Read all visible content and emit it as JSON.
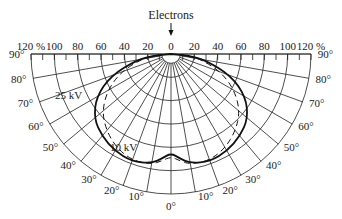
{
  "figure": {
    "title_label": "Electrons",
    "arrow": "down-arrow",
    "radial_axis": {
      "unit": "%",
      "ticks_left": [
        "120 %",
        "100",
        "80",
        "60",
        "40",
        "20"
      ],
      "center_tick": "0",
      "ticks_right": [
        "20",
        "40",
        "60",
        "80",
        "100",
        "120 %"
      ],
      "max": 120,
      "step": 20
    },
    "angle_labels_left": [
      "90°",
      "80°",
      "70°",
      "60°",
      "50°",
      "40°",
      "30°",
      "20°",
      "10°"
    ],
    "center_angle_label": "0°",
    "angle_labels_right": [
      "10°",
      "20°",
      "30°",
      "40°",
      "50°",
      "60°",
      "70°",
      "80°",
      "90°"
    ],
    "curves": [
      {
        "name": "25 kV",
        "label": "25 kV",
        "style": "solid"
      },
      {
        "name": "10 kV",
        "label": "10 kV",
        "style": "dashed"
      }
    ]
  },
  "chart_data": {
    "type": "polar",
    "title": "Electrons",
    "r_unit": "%",
    "r_range": [
      0,
      120
    ],
    "r_ticks": [
      0,
      20,
      40,
      60,
      80,
      100,
      120
    ],
    "theta_unit": "deg",
    "theta_range": [
      -90,
      90
    ],
    "theta_ticks": [
      -90,
      -80,
      -70,
      -60,
      -50,
      -40,
      -30,
      -20,
      -10,
      0,
      10,
      20,
      30,
      40,
      50,
      60,
      70,
      80,
      90
    ],
    "theta_zero": "downward",
    "series": [
      {
        "name": "25 kV",
        "style": "solid",
        "theta": [
          0,
          5,
          10,
          20,
          30,
          40,
          50,
          60,
          70,
          80,
          85,
          90
        ],
        "r": [
          85,
          90,
          95,
          98,
          96,
          92,
          86,
          74,
          55,
          30,
          15,
          0
        ]
      },
      {
        "name": "10 kV",
        "style": "dashed",
        "theta": [
          0,
          5,
          10,
          20,
          30,
          40,
          50,
          60,
          70,
          80,
          85,
          90
        ],
        "r": [
          88,
          92,
          96,
          97,
          93,
          86,
          77,
          63,
          46,
          26,
          13,
          0
        ]
      }
    ],
    "annotations": [
      "Electrons",
      "25 kV",
      "10 kV"
    ]
  }
}
